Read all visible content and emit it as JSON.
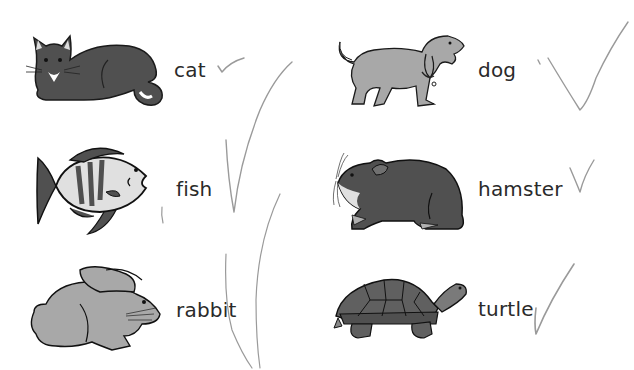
{
  "worksheet": {
    "animals": [
      {
        "name": "cat",
        "icon": "cat-icon",
        "checked": true
      },
      {
        "name": "dog",
        "icon": "dog-icon",
        "checked": true
      },
      {
        "name": "fish",
        "icon": "fish-icon",
        "checked": true
      },
      {
        "name": "hamster",
        "icon": "hamster-icon",
        "checked": true
      },
      {
        "name": "rabbit",
        "icon": "rabbit-icon",
        "checked": true
      },
      {
        "name": "turtle",
        "icon": "turtle-icon",
        "checked": true
      }
    ]
  },
  "colors": {
    "ink": "#2a2a2a",
    "dark_fur": "#505050",
    "light_fur": "#a8a8a8",
    "pencil": "#9a9a9a"
  }
}
